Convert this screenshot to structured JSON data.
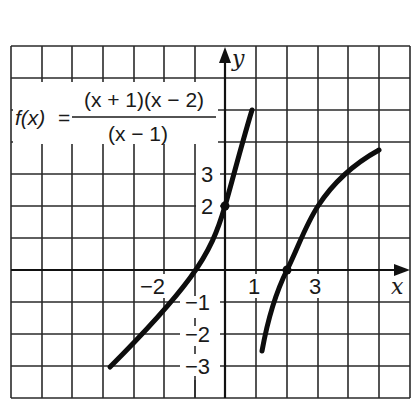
{
  "figure": {
    "formula": {
      "lhs": "f(x)",
      "equals": "=",
      "numerator": "(x + 1)(x − 2)",
      "denominator": "(x − 1)"
    },
    "axes": {
      "x_label": "x",
      "y_label": "y"
    },
    "x_tick_labels": [
      {
        "value": -2,
        "text": "−2"
      },
      {
        "value": 1,
        "text": "1"
      },
      {
        "value": 3,
        "text": "3"
      }
    ],
    "y_tick_labels": [
      {
        "value": 3,
        "text": "3"
      },
      {
        "value": 2,
        "text": "2"
      },
      {
        "value": -1,
        "text": "−1"
      },
      {
        "value": -2,
        "text": "−2"
      },
      {
        "value": -3,
        "text": "−3"
      }
    ],
    "grid": {
      "x_range": [
        -7,
        6
      ],
      "y_range": [
        -4,
        7
      ],
      "step": 1
    },
    "points": [
      {
        "x": 0,
        "y": 2,
        "label": "y-intercept"
      },
      {
        "x": 2,
        "y": 0,
        "label": "x-intercept"
      }
    ],
    "branches": [
      {
        "name": "left-branch",
        "x_start": -3.75,
        "x_end": 0.88,
        "y_start": -3,
        "y_end": 5
      },
      {
        "name": "right-branch",
        "x_start": 1.2,
        "x_end": 5,
        "y_start": -2.5,
        "y_end": 3.75
      }
    ],
    "colors": {
      "line": "#111111",
      "background": "#ffffff"
    }
  }
}
